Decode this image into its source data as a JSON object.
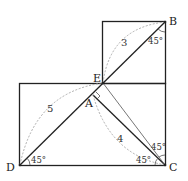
{
  "diagram": {
    "points": {
      "A": "A",
      "B": "B",
      "C": "C",
      "D": "D",
      "E": "E"
    },
    "lengths": {
      "EB": "3",
      "DE": "5",
      "AC": "4"
    },
    "angles": {
      "B": "45°",
      "D": "45°",
      "C_upper": "45°",
      "C_lower": "45°"
    }
  }
}
